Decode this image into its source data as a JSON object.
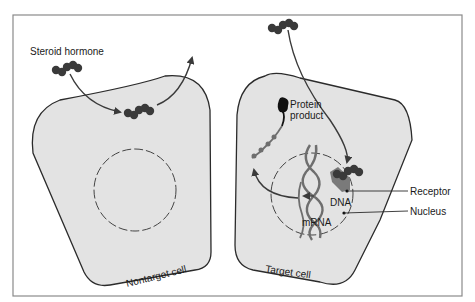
{
  "figure": {
    "labels": {
      "steroid_hormone": "Steroid hormone",
      "protein_product_line1": "Protein",
      "protein_product_line2": "product",
      "receptor": "Receptor",
      "dna": "DNA",
      "nucleus": "Nucleus",
      "mrna": "mRNA",
      "nontarget_cell": "Nontarget cell",
      "target_cell": "Target cell"
    },
    "colors": {
      "cell_fill": "#e3e3e3",
      "outline": "#2b2b2b",
      "frame": "#8a8a8a",
      "hormone": "#3a3a3a",
      "receptor": "#7a7a7a",
      "arrow": "#3a3a3a"
    }
  }
}
